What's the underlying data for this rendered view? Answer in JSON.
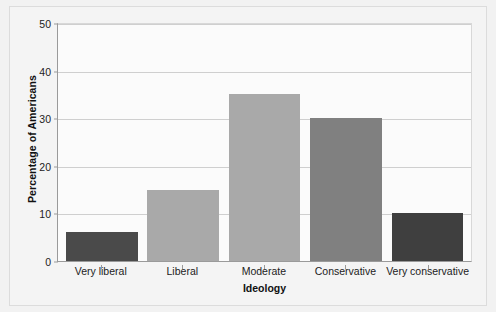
{
  "chart_data": {
    "type": "bar",
    "title": "",
    "xlabel": "Ideology",
    "ylabel": "Percentage of Americans",
    "categories": [
      "Very liberal",
      "Liberal",
      "Moderate",
      "Conservative",
      "Very conservative"
    ],
    "values": [
      6,
      15,
      35,
      30,
      10
    ],
    "bar_colors": [
      "#4a4a4a",
      "#a9a9a9",
      "#a9a9a9",
      "#808080",
      "#3f3f3f"
    ],
    "ylim": [
      0,
      50
    ],
    "ytick_labels": [
      "0",
      "10",
      "20",
      "30",
      "40",
      "50"
    ],
    "ytick_values": [
      0,
      10,
      20,
      30,
      40,
      50
    ],
    "grid": true,
    "legend": "none",
    "plot_background": "#fbfbfb",
    "figure_background": "#f2f2f2",
    "grid_color": "#cfcfcf",
    "axis_color": "#9a9a9a"
  }
}
